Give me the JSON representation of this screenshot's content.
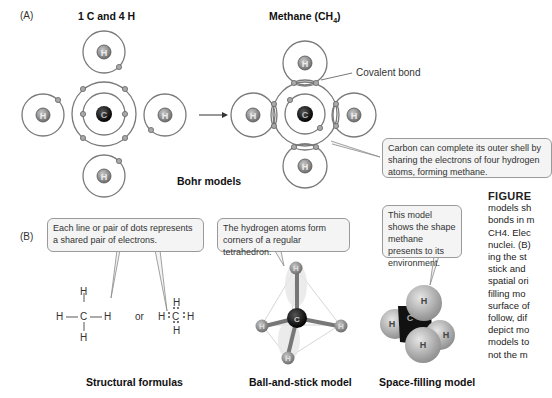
{
  "panel_a": {
    "label": "(A)",
    "left_heading": "1 C and 4 H",
    "right_heading_prefix": "Methane  (CH",
    "right_heading_sub": "4",
    "right_heading_suffix": ")",
    "covalent_bond_label": "Covalent bond",
    "callout": "Carbon can complete its outer shell by sharing the electrons of four hydrogen atoms, forming methane.",
    "caption": "Bohr models",
    "atom_labels": {
      "carbon": "C",
      "hydrogen": "H"
    }
  },
  "panel_b": {
    "label": "(B)",
    "structural": {
      "callout": "Each line or pair of dots represents a shared pair of electrons.",
      "or_text": "or",
      "caption": "Structural formulas"
    },
    "ball_and_stick": {
      "callout": "The hydrogen atoms form corners of a regular tetrahedron.",
      "caption": "Ball-and-stick model"
    },
    "space_filling": {
      "callout": "This model shows the shape methane presents to its environment.",
      "caption": "Space-filling model"
    }
  },
  "figure_text": {
    "title": "FIGURE",
    "lines": [
      "models sh",
      "bonds in m",
      "CH4. Elec",
      "nuclei. (B)",
      "ing the st",
      "stick and",
      "spatial ori",
      "filling mo",
      "surface of",
      "follow, dif",
      "depict mo",
      "models to",
      "not the m"
    ]
  },
  "colors": {
    "orbit": "#7a7a7a",
    "hydrogen": "#8c8c8c",
    "carbon": "#111111",
    "electron": "#a0a0a0",
    "callout_bg": "#f4f4f4",
    "callout_border": "#9a9a9a"
  }
}
